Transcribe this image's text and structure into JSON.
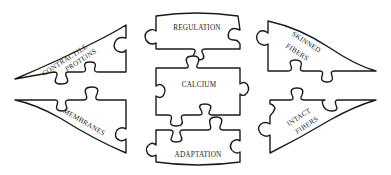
{
  "diagram": {
    "type": "jigsaw-puzzle-concept-map",
    "colors": {
      "stroke": "#1a1a1a",
      "fill": "#ffffff",
      "background": "#ffffff"
    },
    "pieces": {
      "regulation": {
        "label": "REGULATION"
      },
      "calcium": {
        "label": "CALCIUM"
      },
      "adaptation": {
        "label": "ADAPTATION"
      },
      "contractile_proteins": {
        "line1": "CONTRACTILE",
        "line2": "PROTEINS"
      },
      "membranes": {
        "label": "MEMBRANES"
      },
      "skinned_fibers": {
        "line1": "SKINNED",
        "line2": "FIBERS"
      },
      "intact_fibers": {
        "line1": "INTACT",
        "line2": "FIBERS"
      }
    }
  }
}
